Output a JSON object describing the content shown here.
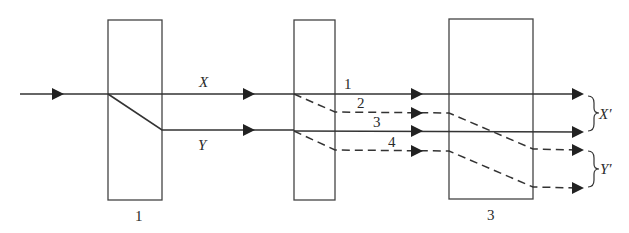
{
  "diagram": {
    "type": "optical beam-splitting schematic",
    "colors": {
      "stroke": "#333333",
      "background": "#ffffff"
    },
    "components": [
      {
        "id": "1",
        "label": "1",
        "x": 108,
        "y": 20,
        "w": 54,
        "h": 180
      },
      {
        "id": "2",
        "label": "",
        "x": 294,
        "y": 20,
        "w": 41,
        "h": 180
      },
      {
        "id": "3",
        "label": "3",
        "x": 449,
        "y": 19,
        "w": 84,
        "h": 180
      }
    ],
    "beam_labels": {
      "x": "X",
      "y": "Y",
      "ray1": "1",
      "ray2": "2",
      "ray3": "3",
      "ray4": "4",
      "x_prime": "X′",
      "y_prime": "Y′"
    },
    "rays": [
      {
        "name": "input",
        "style": "solid",
        "points": [
          [
            20,
            94
          ],
          [
            108,
            94
          ]
        ]
      },
      {
        "name": "X",
        "style": "solid",
        "points": [
          [
            108,
            94
          ],
          [
            294,
            94
          ]
        ]
      },
      {
        "name": "Y",
        "style": "solid",
        "points": [
          [
            108,
            94
          ],
          [
            162,
            130
          ],
          [
            294,
            130
          ]
        ]
      },
      {
        "name": "ray-1",
        "style": "solid",
        "points": [
          [
            294,
            94
          ],
          [
            582,
            94
          ]
        ]
      },
      {
        "name": "ray-2",
        "style": "dashed",
        "points": [
          [
            294,
            94
          ],
          [
            335,
            112
          ],
          [
            449,
            113
          ],
          [
            533,
            149
          ],
          [
            582,
            150
          ]
        ]
      },
      {
        "name": "ray-3",
        "style": "solid",
        "points": [
          [
            294,
            130
          ],
          [
            582,
            132
          ]
        ]
      },
      {
        "name": "ray-4",
        "style": "dashed",
        "points": [
          [
            294,
            131
          ],
          [
            335,
            150
          ],
          [
            449,
            151
          ],
          [
            533,
            187
          ],
          [
            582,
            188
          ]
        ]
      }
    ]
  }
}
